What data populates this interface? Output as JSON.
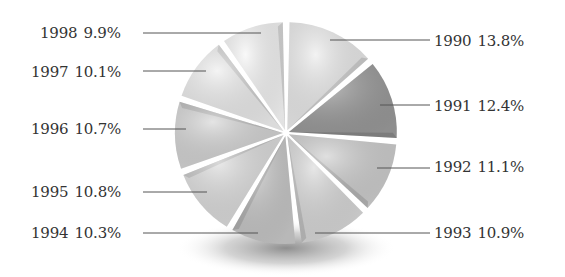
{
  "chart_data": {
    "type": "pie",
    "title": "",
    "style": "exploded 3D grayscale pie with drop shadow",
    "start_angle": "12 o'clock",
    "direction": "clockwise",
    "categories": [
      "1990",
      "1991",
      "1992",
      "1993",
      "1994",
      "1995",
      "1996",
      "1997",
      "1998"
    ],
    "values": [
      13.8,
      12.4,
      11.1,
      10.9,
      10.3,
      10.8,
      10.7,
      10.1,
      9.9
    ],
    "unit": "%",
    "slices": [
      {
        "label": "1990",
        "value": 13.8,
        "text": "13.8%",
        "color": "#ececec",
        "side": "right"
      },
      {
        "label": "1991",
        "value": 12.4,
        "text": "12.4%",
        "color": "#9a9a9a",
        "side": "right"
      },
      {
        "label": "1992",
        "value": 11.1,
        "text": "11.1%",
        "color": "#cfcfcf",
        "side": "right"
      },
      {
        "label": "1993",
        "value": 10.9,
        "text": "10.9%",
        "color": "#dadada",
        "side": "right"
      },
      {
        "label": "1994",
        "value": 10.3,
        "text": "10.3%",
        "color": "#c8c8c8",
        "side": "left"
      },
      {
        "label": "1995",
        "value": 10.8,
        "text": "10.8%",
        "color": "#dedede",
        "side": "left"
      },
      {
        "label": "1996",
        "value": 10.7,
        "text": "10.7%",
        "color": "#d6d6d6",
        "side": "left"
      },
      {
        "label": "1997",
        "value": 10.1,
        "text": "10.1%",
        "color": "#eeeeee",
        "side": "left"
      },
      {
        "label": "1998",
        "value": 9.9,
        "text": "9.9%",
        "color": "#f6f6f6",
        "side": "left"
      }
    ],
    "legend": "none (callout labels with leader lines)"
  },
  "labels": {
    "l1990": {
      "year": "1990",
      "pct": "13.8%"
    },
    "l1991": {
      "year": "1991",
      "pct": "12.4%"
    },
    "l1992": {
      "year": "1992",
      "pct": "11.1%"
    },
    "l1993": {
      "year": "1993",
      "pct": "10.9%"
    },
    "l1994": {
      "year": "1994",
      "pct": "10.3%"
    },
    "l1995": {
      "year": "1995",
      "pct": "10.8%"
    },
    "l1996": {
      "year": "1996",
      "pct": "10.7%"
    },
    "l1997": {
      "year": "1997",
      "pct": "10.1%"
    },
    "l1998": {
      "year": "1998",
      "pct": "9.9%"
    }
  },
  "colors": {
    "text": "#333333",
    "leader_line": "#555555",
    "shadow": "#8a8a8a"
  }
}
